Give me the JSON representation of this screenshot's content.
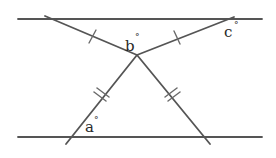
{
  "diagram": {
    "colors": {
      "line": "#555555",
      "text": "#2a2a2a",
      "background": "#ffffff"
    },
    "parallel_lines": [
      {
        "id": "top-line",
        "x1": 18,
        "y1": 19,
        "x2": 262,
        "y2": 19
      },
      {
        "id": "bottom-line",
        "x1": 18,
        "y1": 137,
        "x2": 262,
        "y2": 137
      }
    ],
    "vertex": {
      "x": 137,
      "y": 55
    },
    "segments": [
      {
        "id": "upper-left",
        "x1": 45,
        "y1": 16,
        "x2": 137,
        "y2": 55,
        "ticks": 1
      },
      {
        "id": "upper-right",
        "x1": 137,
        "y1": 55,
        "x2": 234,
        "y2": 17,
        "ticks": 1
      },
      {
        "id": "lower-left",
        "x1": 137,
        "y1": 55,
        "x2": 66,
        "y2": 144,
        "ticks": 2
      },
      {
        "id": "lower-right",
        "x1": 137,
        "y1": 55,
        "x2": 210,
        "y2": 144,
        "ticks": 2
      }
    ],
    "labels": {
      "a": {
        "text": "a",
        "degree": "°",
        "x": 84,
        "y": 132
      },
      "b": {
        "text": "b",
        "degree": "°",
        "x": 131,
        "y": 51
      },
      "c": {
        "text": "c",
        "degree": "°",
        "x": 226,
        "y": 36
      }
    }
  }
}
